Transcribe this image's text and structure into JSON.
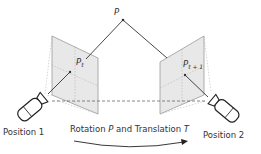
{
  "diagram": {
    "point_label": "P",
    "left_projection": {
      "base": "P",
      "subscript": "t"
    },
    "right_projection": {
      "base": "P",
      "subscript": "t + 1"
    },
    "camera_left_label": "Position 1",
    "camera_right_label": "Position 2",
    "transform_caption": {
      "prefix": "Rotation ",
      "rotation_symbol": "P",
      "middle": " and Translation ",
      "translation_symbol": "T"
    },
    "colors": {
      "line": "#333333",
      "plane_fill": "#e6e6e6",
      "plane_stroke": "#9a9a9a",
      "dashed": "#555555"
    }
  }
}
